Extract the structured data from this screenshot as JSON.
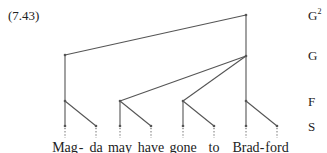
{
  "example_number": "(7.43)",
  "levels": [
    {
      "id": "G2",
      "label": "G",
      "sup": "2",
      "y": 15
    },
    {
      "id": "G",
      "label": "G",
      "sup": "",
      "y": 55
    },
    {
      "id": "F",
      "label": "F",
      "sup": "",
      "y": 101
    },
    {
      "id": "S",
      "label": "S",
      "sup": "",
      "y": 126
    }
  ],
  "syllables": [
    {
      "text": "Mag",
      "x": 65
    },
    {
      "text": "da",
      "x": 96
    },
    {
      "text": "may",
      "x": 120
    },
    {
      "text": "have",
      "x": 151
    },
    {
      "text": "gone",
      "x": 183
    },
    {
      "text": "to",
      "x": 214
    },
    {
      "text": "Brad",
      "x": 246
    },
    {
      "text": "ford",
      "x": 277
    }
  ],
  "hyphens": [
    {
      "text": "-",
      "x": 81
    },
    {
      "text": "-",
      "x": 262
    }
  ],
  "tree": {
    "nodes": [
      {
        "id": "g2",
        "x": 246,
        "y": 15
      },
      {
        "id": "gL",
        "x": 65,
        "y": 55
      },
      {
        "id": "gR",
        "x": 246,
        "y": 56
      },
      {
        "id": "f1",
        "x": 65,
        "y": 101
      },
      {
        "id": "f2",
        "x": 120,
        "y": 101
      },
      {
        "id": "f3",
        "x": 183,
        "y": 101
      },
      {
        "id": "f4",
        "x": 246,
        "y": 101
      },
      {
        "id": "s1",
        "x": 65,
        "y": 126
      },
      {
        "id": "s2",
        "x": 96,
        "y": 126
      },
      {
        "id": "s3",
        "x": 120,
        "y": 126
      },
      {
        "id": "s4",
        "x": 151,
        "y": 126
      },
      {
        "id": "s5",
        "x": 183,
        "y": 126
      },
      {
        "id": "s6",
        "x": 214,
        "y": 126
      },
      {
        "id": "s7",
        "x": 246,
        "y": 126
      },
      {
        "id": "s8",
        "x": 277,
        "y": 126
      }
    ],
    "edges": [
      [
        "g2",
        "gL"
      ],
      [
        "g2",
        "gR"
      ],
      [
        "gL",
        "f1"
      ],
      [
        "gR",
        "f2"
      ],
      [
        "gR",
        "f3"
      ],
      [
        "gR",
        "f4"
      ],
      [
        "f1",
        "s1"
      ],
      [
        "f1",
        "s2"
      ],
      [
        "f2",
        "s3"
      ],
      [
        "f2",
        "s4"
      ],
      [
        "f3",
        "s5"
      ],
      [
        "f3",
        "s6"
      ],
      [
        "f4",
        "s7"
      ],
      [
        "f4",
        "s8"
      ]
    ],
    "line_color": "#555555"
  }
}
